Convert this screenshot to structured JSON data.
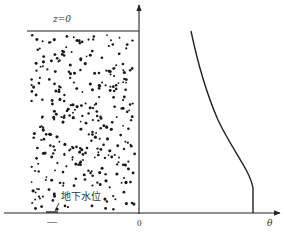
{
  "diagram": {
    "top_label": "z=0",
    "origin_label": "0",
    "x_axis_label": "θ",
    "water_table_label": "地下水位",
    "water_table_marker": "—",
    "colors": {
      "line": "#222222",
      "dot": "#1a1a1a",
      "background": "#ffffff"
    }
  }
}
